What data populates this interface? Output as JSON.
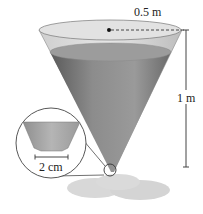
{
  "diagram": {
    "labels": {
      "radius": "0.5 m",
      "height": "1 m",
      "hole_diameter": "2 cm"
    },
    "colors": {
      "cone_outer": "#d4d4d4",
      "water_dark": "#6e6e6e",
      "water_light": "#a8a8a8",
      "water_surface": "#9a9a9a",
      "puddle": "#d6d6d6",
      "line": "#333333"
    }
  }
}
